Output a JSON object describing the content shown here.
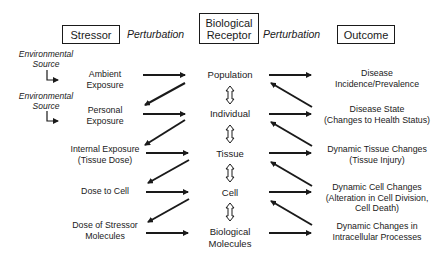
{
  "headers": {
    "stressor": "Stressor",
    "perturbation_left": "Perturbation",
    "receptor_line1": "Biological",
    "receptor_line2": "Receptor",
    "perturbation_right": "Perturbation",
    "outcome": "Outcome"
  },
  "sources": [
    {
      "line1": "Environmental",
      "line2": "Source"
    },
    {
      "line1": "Environmental",
      "line2": "Source"
    }
  ],
  "stressor_column": [
    {
      "line1": "Ambient",
      "line2": "Exposure"
    },
    {
      "line1": "Personal",
      "line2": "Exposure"
    },
    {
      "line1": "Internal Exposure",
      "line2": "(Tissue Dose)"
    },
    {
      "line1": "Dose to Cell",
      "line2": ""
    },
    {
      "line1": "Dose of Stressor",
      "line2": "Molecules"
    }
  ],
  "receptor_column": [
    {
      "line1": "Population",
      "line2": ""
    },
    {
      "line1": "Individual",
      "line2": ""
    },
    {
      "line1": "Tissue",
      "line2": ""
    },
    {
      "line1": "Cell",
      "line2": ""
    },
    {
      "line1": "Biological",
      "line2": "Molecules"
    }
  ],
  "outcome_column": [
    {
      "line1": "Disease",
      "line2": "Incidence/Prevalence",
      "line3": ""
    },
    {
      "line1": "Disease State",
      "line2": "(Changes to Health Status)",
      "line3": ""
    },
    {
      "line1": "Dynamic Tissue Changes",
      "line2": "(Tissue Injury)",
      "line3": ""
    },
    {
      "line1": "Dynamic Cell Changes",
      "line2": "(Alteration in Cell Division,",
      "line3": "Cell Death)"
    },
    {
      "line1": "Dynamic Changes in",
      "line2": "Intracellular Processes",
      "line3": ""
    }
  ],
  "colors": {
    "line": "#1a1a1a",
    "background": "#ffffff"
  }
}
